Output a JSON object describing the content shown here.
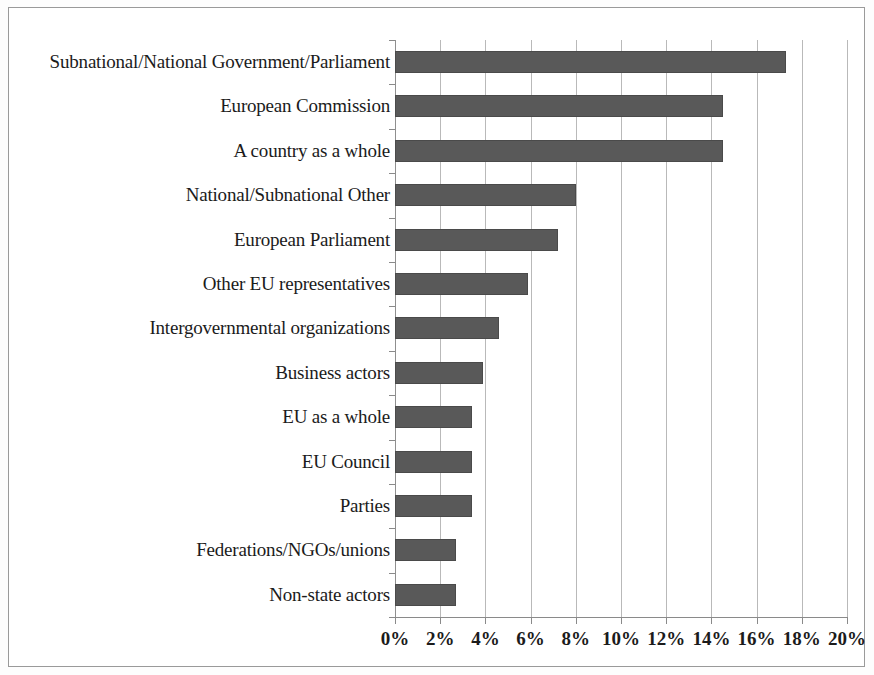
{
  "chart_data": {
    "type": "bar",
    "orientation": "horizontal",
    "title": "",
    "subtitle": "",
    "xlabel": "",
    "ylabel": "",
    "xlim": [
      0,
      20
    ],
    "xtick_labels": [
      "0%",
      "2%",
      "4%",
      "6%",
      "8%",
      "10%",
      "12%",
      "14%",
      "16%",
      "18%",
      "20%"
    ],
    "xtick_values": [
      0,
      2,
      4,
      6,
      8,
      10,
      12,
      14,
      16,
      18,
      20
    ],
    "grid": "vertical",
    "legend": "none",
    "value_suffix": "%",
    "categories": [
      "Subnational/National Government/Parliament",
      "European Commission",
      "A country as a whole",
      "National/Subnational Other",
      "European Parliament",
      "Other EU representatives",
      "Intergovernmental organizations",
      "Business actors",
      "EU as a whole",
      "EU Council",
      "Parties",
      "Federations/NGOs/unions",
      "Non-state actors"
    ],
    "values": [
      17.3,
      14.5,
      14.5,
      8.0,
      7.2,
      5.9,
      4.6,
      3.9,
      3.4,
      3.4,
      3.4,
      2.7,
      2.7
    ],
    "series": [
      {
        "name": "Share of references",
        "values": [
          17.3,
          14.5,
          14.5,
          8.0,
          7.2,
          5.9,
          4.6,
          3.9,
          3.4,
          3.4,
          3.4,
          2.7,
          2.7
        ]
      }
    ],
    "colors": {
      "bar_fill": "#595959",
      "bar_border": "#4a4a4a",
      "gridline": "#b9b9b9",
      "axis": "#8a8a8a",
      "text": "#1b1b1b",
      "frame": "#9a9a9a",
      "background": "#ffffff"
    }
  }
}
